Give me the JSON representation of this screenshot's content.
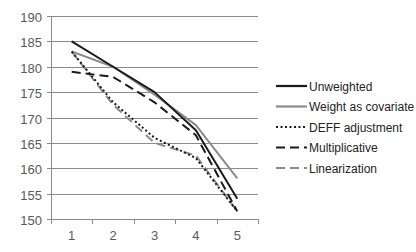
{
  "chart_data": {
    "type": "line",
    "title": "",
    "xlabel": "",
    "ylabel": "",
    "categories": [
      "1",
      "2",
      "3",
      "4",
      "5"
    ],
    "ylim": [
      150,
      190
    ],
    "yticks": [
      150,
      155,
      160,
      165,
      170,
      175,
      180,
      185,
      190
    ],
    "grid": "horizontal",
    "legend_position": "right",
    "series": [
      {
        "name": "Unweighted",
        "values": [
          185,
          180,
          175,
          167.5,
          154
        ],
        "color": "#1a1a1a",
        "dash": "solid",
        "width": 2
      },
      {
        "name": "Weight as covariate",
        "values": [
          183,
          180,
          174.5,
          168.5,
          158
        ],
        "color": "#8c8c8c",
        "dash": "solid",
        "width": 2
      },
      {
        "name": "DEFF adjustment",
        "values": [
          183,
          173,
          166,
          162,
          151.5
        ],
        "color": "#1a1a1a",
        "dash": "dot",
        "width": 2
      },
      {
        "name": "Multiplicative",
        "values": [
          179,
          178,
          173,
          166.5,
          151.5
        ],
        "color": "#1a1a1a",
        "dash": "dash",
        "width": 2
      },
      {
        "name": "Linearization",
        "values": [
          183,
          172.5,
          165,
          162.5,
          151.5
        ],
        "color": "#8c8c8c",
        "dash": "dash",
        "width": 2
      }
    ]
  }
}
